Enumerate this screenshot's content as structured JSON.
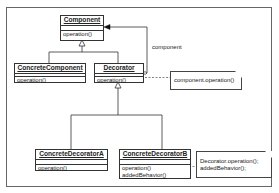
{
  "diagram": {
    "type": "UML class diagram",
    "classes": {
      "component": {
        "name": "Component",
        "operations": [
          "operation()"
        ]
      },
      "concrete_component": {
        "name": "ConcreteComponent",
        "operations": [
          "operation()"
        ]
      },
      "decorator": {
        "name": "Decorator",
        "operations": [
          "operation()"
        ]
      },
      "concrete_decorator_a": {
        "name": "ConcreteDecoratorA",
        "operations": [
          "operation()"
        ]
      },
      "concrete_decorator_b": {
        "name": "ConcreteDecoratorB",
        "operations": [
          "operation()",
          "addedBehavior()"
        ]
      }
    },
    "association_label": "component",
    "notes": {
      "decorator_note": "component.operation()",
      "concrete_b_note_line1": "Decorator.operation();",
      "concrete_b_note_line2": "addedBehavior();"
    },
    "colors": {
      "line": "#333333",
      "frame": "#666666",
      "background": "#ffffff"
    }
  }
}
